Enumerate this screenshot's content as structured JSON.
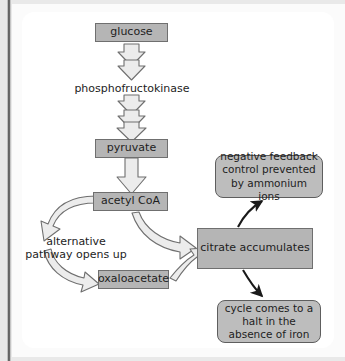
{
  "figure": {
    "type": "flow-diagram",
    "background_color": "#ffffff",
    "node_fill": "#b5b5b5",
    "node_stroke": "#6f6f6f",
    "block_arrow_fill": "#ececec",
    "block_arrow_stroke": "#6f6f6f",
    "thin_arrow_color": "#1a1a1a"
  },
  "nodes": {
    "glucose": {
      "label": "glucose",
      "shape": "rect"
    },
    "pyruvate": {
      "label": "pyruvate",
      "shape": "rect"
    },
    "acetyl_coa": {
      "label": "acetyl CoA",
      "shape": "rect"
    },
    "oxaloacetate": {
      "label": "oxaloacetate",
      "shape": "rect"
    },
    "citrate": {
      "label": "citrate accumulates",
      "shape": "rect"
    },
    "negative_feedback": {
      "label": "negative feedback control prevented by ammonium ions",
      "shape": "rounded-rect"
    },
    "halt": {
      "label": "cycle comes to a halt in the absence of iron",
      "shape": "rounded-rect"
    }
  },
  "labels": {
    "enzyme": "phosphofructokinase",
    "alternative_pathway": "alternative pathway opens up"
  },
  "edges": [
    {
      "from": "glucose",
      "to": "phosphofructokinase",
      "style": "stacked-block-arrows",
      "count": 2,
      "direction": "down"
    },
    {
      "from": "phosphofructokinase",
      "to": "pyruvate",
      "style": "stacked-block-arrows",
      "count": 3,
      "direction": "down"
    },
    {
      "from": "pyruvate",
      "to": "acetyl_coa",
      "style": "block-arrow",
      "direction": "down"
    },
    {
      "from": "acetyl_coa",
      "to": "alternative_pathway",
      "style": "curved-block-arrow",
      "direction": "left-down"
    },
    {
      "from": "alternative_pathway",
      "to": "oxaloacetate",
      "style": "curved-block-arrow",
      "direction": "down-right"
    },
    {
      "from": "acetyl_coa",
      "to": "citrate",
      "style": "curved-block-arrow",
      "direction": "right-down"
    },
    {
      "from": "oxaloacetate",
      "to": "citrate",
      "style": "curved-block-arrow",
      "direction": "right-up"
    },
    {
      "from": "citrate",
      "to": "negative_feedback",
      "style": "thin-curved-arrow",
      "direction": "up-right"
    },
    {
      "from": "citrate",
      "to": "halt",
      "style": "thin-curved-arrow",
      "direction": "down-right"
    }
  ]
}
